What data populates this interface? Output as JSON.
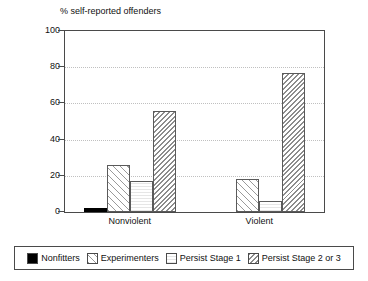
{
  "chart_data": {
    "type": "bar",
    "title": "% self-reported offenders",
    "xlabel": "",
    "ylabel": "",
    "ylim": [
      0,
      100
    ],
    "yticks": [
      0,
      20,
      40,
      60,
      80,
      100
    ],
    "grid": true,
    "legend_position": "bottom",
    "categories": [
      "Nonviolent",
      "Violent"
    ],
    "series": [
      {
        "name": "Nonfitters",
        "pattern": "solid-black",
        "values": [
          2,
          0
        ]
      },
      {
        "name": "Experimenters",
        "pattern": "forward-diagonal",
        "values": [
          26,
          18
        ]
      },
      {
        "name": "Persist Stage 1",
        "pattern": "plain-light",
        "values": [
          17,
          6
        ]
      },
      {
        "name": "Persist Stage 2 or 3",
        "pattern": "dense-back-diagonal",
        "values": [
          56,
          77
        ]
      }
    ]
  },
  "axis": {
    "y_tick_labels": [
      "0",
      "20",
      "40",
      "60",
      "80",
      "100"
    ]
  },
  "legend": {
    "entries": [
      {
        "label": "Nonfitters"
      },
      {
        "label": "Experimenters"
      },
      {
        "label": "Persist Stage 1"
      },
      {
        "label": "Persist Stage 2 or 3"
      }
    ]
  }
}
